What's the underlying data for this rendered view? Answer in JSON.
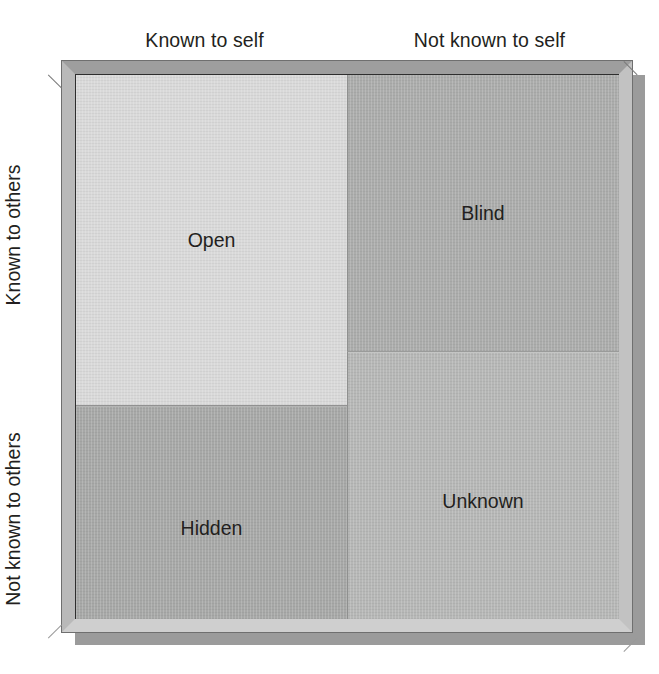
{
  "diagram": {
    "columns": [
      {
        "id": "known-to-self",
        "label": "Known to self"
      },
      {
        "id": "not-known-to-self",
        "label": "Not known to self"
      }
    ],
    "rows": [
      {
        "id": "known-to-others",
        "label": "Known to others"
      },
      {
        "id": "not-known-to-others",
        "label": "Not known to others"
      }
    ],
    "quadrants": [
      {
        "id": "open",
        "label": "Open",
        "row": "known-to-others",
        "column": "known-to-self",
        "fill": "#d9d9d9"
      },
      {
        "id": "blind",
        "label": "Blind",
        "row": "known-to-others",
        "column": "not-known-to-self",
        "fill": "#abacab"
      },
      {
        "id": "hidden",
        "label": "Hidden",
        "row": "not-known-to-others",
        "column": "known-to-self",
        "fill": "#a7a8a7"
      },
      {
        "id": "unknown",
        "label": "Unknown",
        "row": "not-known-to-others",
        "column": "not-known-to-self",
        "fill": "#b6b7b6"
      }
    ],
    "frame": {
      "style": "beveled-picture-frame",
      "bevel_top": "#9e9e9e",
      "bevel_left": "#b9b9b9",
      "bevel_right": "#c2c2c2",
      "bevel_bottom": "#cfcfcf",
      "inner_border": "#2e2e2e",
      "shadow": "#9b9b9b"
    },
    "text_color": "#231f20",
    "background": "#ffffff"
  }
}
